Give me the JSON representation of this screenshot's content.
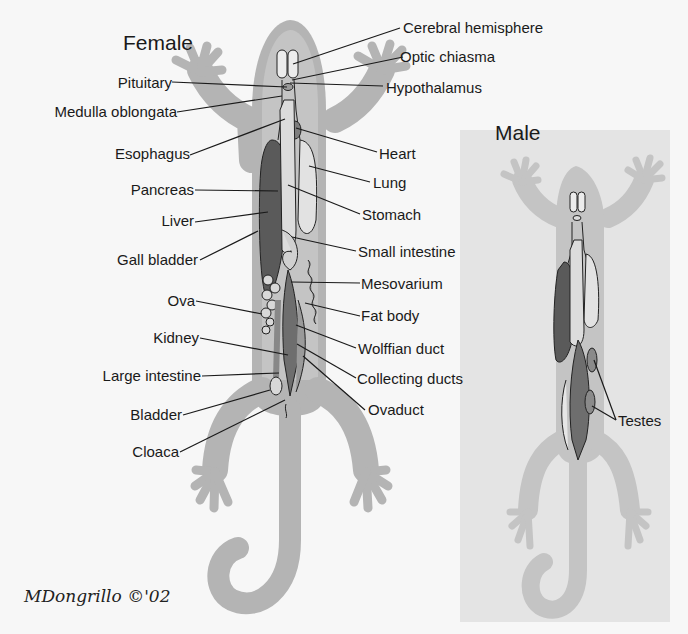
{
  "colors": {
    "background": "#f7f7f7",
    "male_panel": "#e4e4e4",
    "body": "#b4b4b4",
    "body_inner": "#c4c4c4",
    "liver": "#5a5a5a",
    "organ_light": "#dedede",
    "organ_mid": "#9a9a9a",
    "organ_dark": "#6e6e6e",
    "line": "#1a1a1a"
  },
  "female": {
    "title": "Female",
    "labels_left": [
      {
        "id": "pituitary",
        "text": "Pituitary"
      },
      {
        "id": "medulla",
        "text": "Medulla oblongata"
      },
      {
        "id": "esophagus",
        "text": "Esophagus"
      },
      {
        "id": "pancreas",
        "text": "Pancreas"
      },
      {
        "id": "liver",
        "text": "Liver"
      },
      {
        "id": "gall-bladder",
        "text": "Gall bladder"
      },
      {
        "id": "ova",
        "text": "Ova"
      },
      {
        "id": "kidney",
        "text": "Kidney"
      },
      {
        "id": "large-intestine",
        "text": "Large intestine"
      },
      {
        "id": "bladder",
        "text": "Bladder"
      },
      {
        "id": "cloaca",
        "text": "Cloaca"
      }
    ],
    "labels_right": [
      {
        "id": "cerebral-hemisphere",
        "text": "Cerebral hemisphere"
      },
      {
        "id": "optic-chiasma",
        "text": "Optic chiasma"
      },
      {
        "id": "hypothalamus",
        "text": "Hypothalamus"
      },
      {
        "id": "heart",
        "text": "Heart"
      },
      {
        "id": "lung",
        "text": "Lung"
      },
      {
        "id": "stomach",
        "text": "Stomach"
      },
      {
        "id": "small-intestine",
        "text": "Small intestine"
      },
      {
        "id": "mesovarium",
        "text": "Mesovarium"
      },
      {
        "id": "fat-body",
        "text": "Fat body"
      },
      {
        "id": "wolffian-duct",
        "text": "Wolffian duct"
      },
      {
        "id": "collecting-ducts",
        "text": "Collecting ducts"
      },
      {
        "id": "ovaduct",
        "text": "Ovaduct"
      }
    ]
  },
  "male": {
    "title": "Male",
    "labels": [
      {
        "id": "testes",
        "text": "Testes"
      }
    ]
  },
  "signature": "MDongrillo ©'02"
}
